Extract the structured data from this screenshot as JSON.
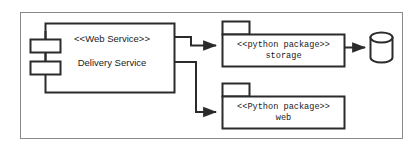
{
  "diagram": {
    "type": "uml-component-diagram",
    "frame": {
      "border_color": "#8a8a8a",
      "background": "#ffffff"
    },
    "stroke_color": "#2b2b2b",
    "component": {
      "stereotype": "<<Web Service>>",
      "name": "Delivery Service",
      "shape": "uml-component",
      "tabs": 2
    },
    "packages": [
      {
        "id": "storage",
        "stereotype": "<<python package>>",
        "name": "storage",
        "shape": "uml-package"
      },
      {
        "id": "web",
        "stereotype": "<<Python package>>",
        "name": "web",
        "shape": "uml-package"
      }
    ],
    "datastore": {
      "id": "database",
      "shape": "cylinder",
      "label": ""
    },
    "connectors": [
      {
        "id": "delivery-to-storage",
        "from": "delivery-service",
        "to": "storage",
        "style": "solid",
        "arrow": "filled"
      },
      {
        "id": "delivery-to-web",
        "from": "delivery-service",
        "to": "web",
        "style": "solid",
        "arrow": "filled"
      },
      {
        "id": "storage-to-database",
        "from": "storage",
        "to": "database",
        "style": "solid",
        "arrow": "filled"
      }
    ]
  }
}
